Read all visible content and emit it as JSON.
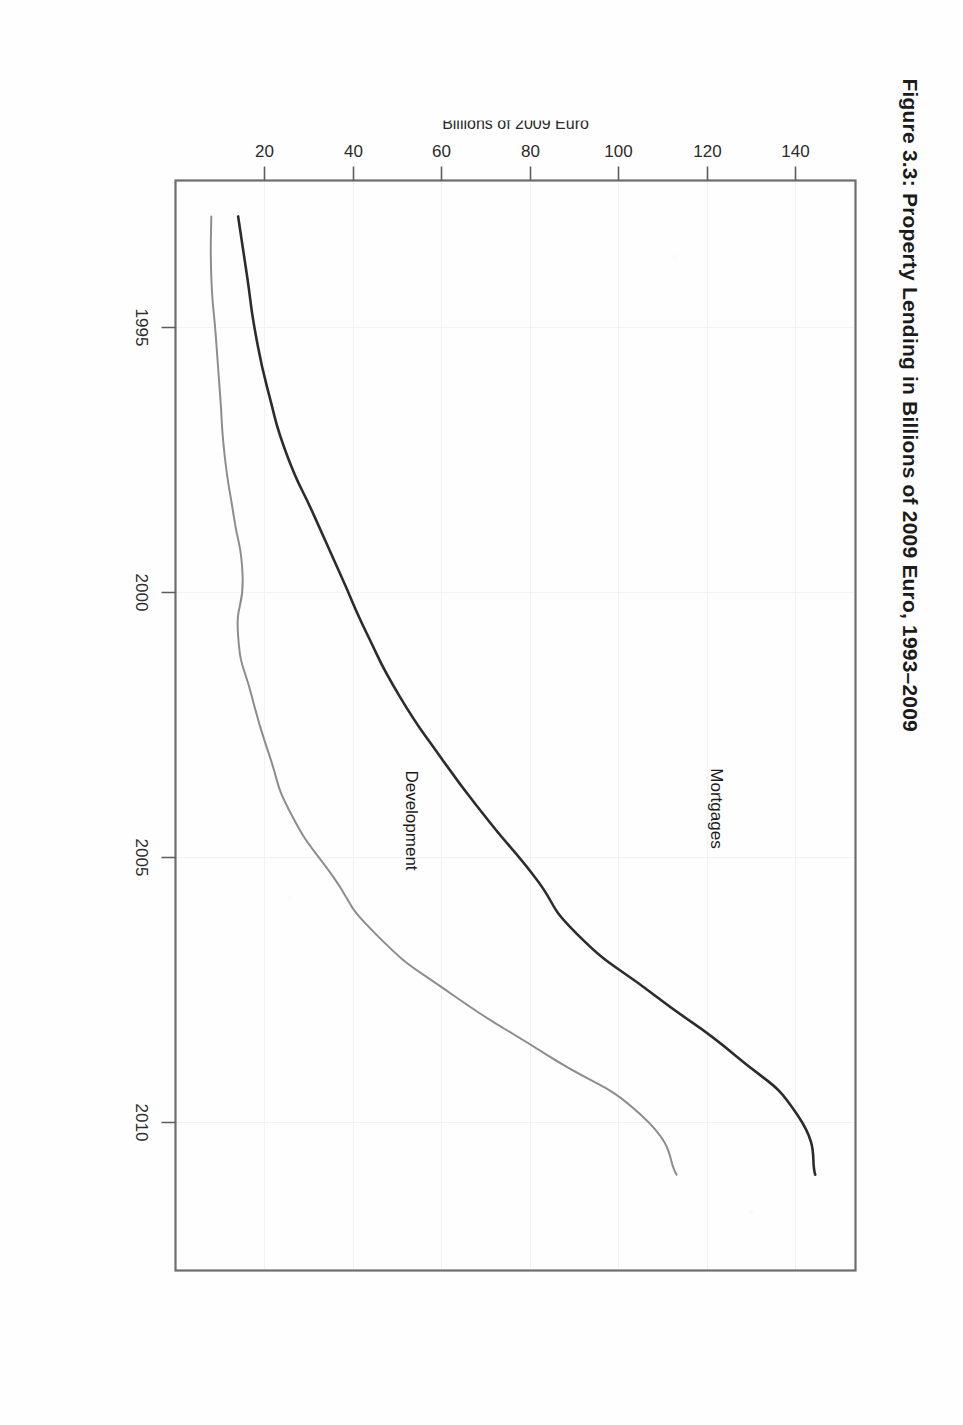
{
  "figure": {
    "title": "Figure 3.3: Property Lending in Billions of 2009 Euro, 1993–2009",
    "page_orientation": "rotated-90-ccw",
    "background_color": "#ffffff"
  },
  "axes": {
    "x": {
      "label": "",
      "tick_labels": [
        "1995",
        "2000",
        "2005",
        "2010"
      ],
      "tick_values": [
        1995,
        2000,
        2005,
        2010
      ],
      "range": [
        1992.4,
        2010.6
      ]
    },
    "y": {
      "label": "Billions of 2009 Euro",
      "tick_labels": [
        "20",
        "40",
        "60",
        "80",
        "100",
        "120",
        "140"
      ],
      "tick_values": [
        20,
        40,
        60,
        80,
        100,
        120,
        140
      ],
      "range": [
        0,
        152
      ]
    }
  },
  "series_labels": [
    {
      "name": "mortgages-label",
      "text": "Mortgages",
      "color": "#2c2c2c"
    },
    {
      "name": "development-label",
      "text": "Development",
      "color": "#8d8d8d"
    }
  ],
  "colors": {
    "mortgages_line": "#2c2c2c",
    "development_line": "#8d8d8d",
    "frame": "#6d6d6d",
    "grid": "#f2f2f2",
    "text": "#1b1b1b"
  },
  "chart_data": {
    "type": "line",
    "title": "Figure 3.3: Property Lending in Billions of 2009 Euro, 1993–2009",
    "xlabel": "",
    "ylabel": "Billions of 2009 Euro",
    "xlim": [
      1992.4,
      2010.6
    ],
    "ylim": [
      0,
      152
    ],
    "xticks": [
      1995,
      2000,
      2005,
      2010
    ],
    "yticks": [
      20,
      40,
      60,
      80,
      100,
      120,
      140
    ],
    "grid": true,
    "legend": "inline-annotations",
    "x": [
      1993,
      1994,
      1995,
      1996,
      1997,
      1998,
      1999,
      2000,
      2001,
      2002,
      2003,
      2004,
      2005,
      2006,
      2007,
      2008,
      2009
    ],
    "series": [
      {
        "name": "Mortgages",
        "color": "#2c2c2c",
        "values": [
          14,
          16,
          18,
          21,
          25,
          31,
          37,
          43,
          50,
          59,
          69,
          80,
          90,
          107,
          125,
          139,
          143
        ]
      },
      {
        "name": "Development",
        "color": "#8d8d8d",
        "values": [
          8,
          8,
          9,
          10,
          11,
          13,
          15,
          14,
          17,
          21,
          26,
          35,
          45,
          62,
          83,
          104,
          112
        ]
      }
    ]
  }
}
